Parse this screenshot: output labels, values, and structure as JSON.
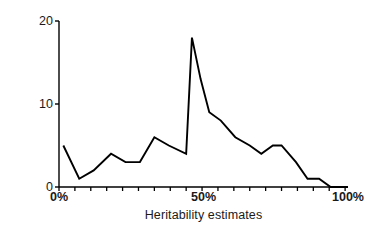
{
  "chart_data": {
    "type": "line",
    "title": "",
    "xlabel": "Heritability estimates",
    "ylabel": "No. of studies",
    "xlim": [
      0,
      100
    ],
    "ylim": [
      0,
      20
    ],
    "grid": false,
    "legend": "none",
    "x_tick_labels": [
      "0%",
      "50%",
      "100%"
    ],
    "x_tick_values": [
      0,
      50,
      100
    ],
    "x_minor_tick_values": [
      0,
      5.5,
      11,
      16.5,
      22,
      27.5,
      33,
      38.5,
      44,
      49.5,
      55,
      60.5,
      66,
      71.5,
      77,
      82.5,
      88,
      93.5,
      99
    ],
    "y_tick_labels": [
      "0",
      "10",
      "20"
    ],
    "y_tick_values": [
      0,
      10,
      20
    ],
    "line_color": "#000000",
    "axis_color": "#000000",
    "x": [
      1.5,
      7,
      12,
      18,
      23,
      28,
      33,
      38,
      44,
      46,
      49,
      52,
      56,
      61,
      66,
      70,
      74,
      77,
      82,
      86,
      90,
      94,
      100
    ],
    "values": [
      5,
      1,
      2,
      4,
      3,
      3,
      6,
      5,
      4,
      18,
      13,
      9,
      8,
      6,
      5,
      4,
      5,
      5,
      3,
      1,
      1,
      0,
      0
    ],
    "series": [
      {
        "name": "No. of studies",
        "values": [
          5,
          1,
          2,
          4,
          3,
          3,
          6,
          5,
          4,
          18,
          13,
          9,
          8,
          6,
          5,
          4,
          5,
          5,
          3,
          1,
          1,
          0,
          0
        ]
      }
    ],
    "peak": {
      "x": 46,
      "y": 18
    }
  },
  "axes": {
    "y_title": "No. of studies",
    "x_title": "Heritability estimates"
  }
}
